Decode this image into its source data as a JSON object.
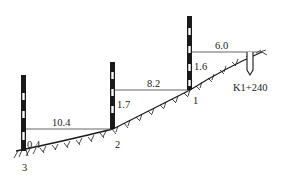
{
  "figure": {
    "stake_label": "K1+240",
    "colors": {
      "ink": "#1a1a1a",
      "line": "#555555",
      "background": "#ffffff"
    }
  },
  "poles": [
    {
      "id": "1",
      "label": "1",
      "height_reading": "1.6"
    },
    {
      "id": "2",
      "label": "2",
      "height_reading": "1.7"
    },
    {
      "id": "3",
      "label": "3",
      "height_reading": "0.4"
    }
  ],
  "horizontal_distances": [
    {
      "from": "K1+240",
      "to": "1",
      "value": "6.0"
    },
    {
      "from": "1",
      "to": "2",
      "value": "8.2"
    },
    {
      "from": "2",
      "to": "3",
      "value": "10.4"
    }
  ]
}
